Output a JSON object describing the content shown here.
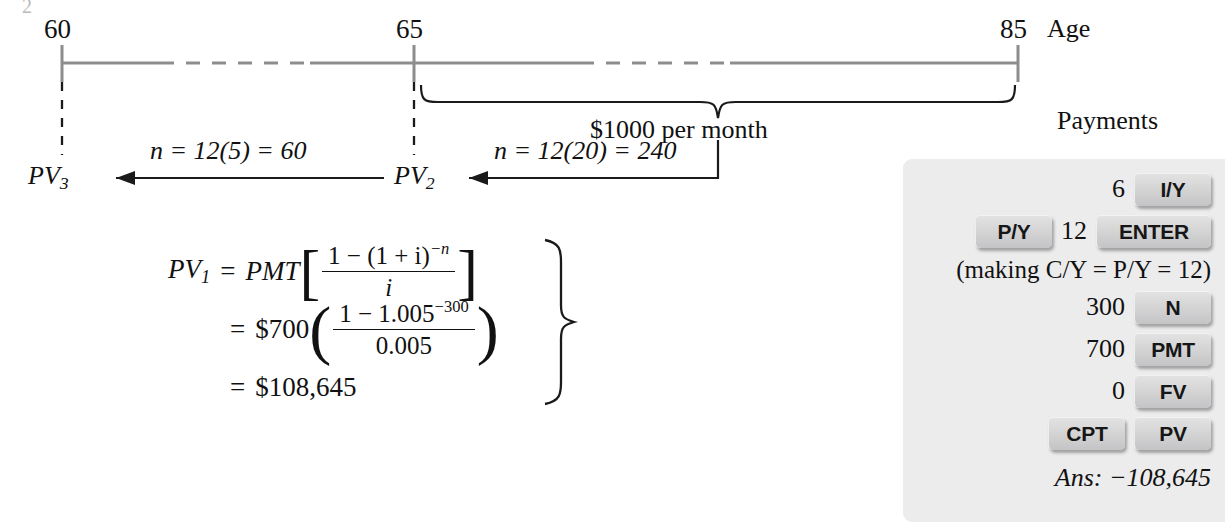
{
  "figure": {
    "stray_mark": "2",
    "timeline": {
      "ticks": [
        {
          "id": "age-60",
          "label": "60"
        },
        {
          "id": "age-65",
          "label": "65"
        },
        {
          "id": "age-85",
          "label": "85"
        }
      ],
      "axis_label": "Age",
      "payments_label": "Payments",
      "brace_label": "$1000 per month"
    },
    "arrows": [
      {
        "id": "pv3",
        "target": "PV",
        "target_sub": "3",
        "annotation": "n = 12(5) = 60"
      },
      {
        "id": "pv2",
        "target": "PV",
        "target_sub": "2",
        "annotation": "n = 12(20) = 240"
      }
    ],
    "formula": {
      "line1": {
        "lhs": "PV",
        "lhs_sub": "1",
        "eq": "=",
        "pmt": "PMT",
        "numerator": "1 − (1 + i)",
        "numerator_exp": "−n",
        "denominator": "i"
      },
      "line2": {
        "eq": "=",
        "coefficient": "$700",
        "numerator": "1 − 1.005",
        "numerator_exp": "−300",
        "denominator": "0.005"
      },
      "line3": {
        "eq": "=",
        "value": "$108,645"
      }
    }
  },
  "calculator": {
    "rows": [
      {
        "type": "key-row",
        "value": "6",
        "keys": [
          "I/Y"
        ]
      },
      {
        "type": "key-row",
        "value": "12",
        "keys": [
          "P/Y",
          "ENTER"
        ],
        "lead_key": "P/Y"
      },
      {
        "type": "note",
        "text": "(making C/Y = P/Y = 12)"
      },
      {
        "type": "key-row",
        "value": "300",
        "keys": [
          "N"
        ]
      },
      {
        "type": "key-row",
        "value": "700",
        "keys": [
          "PMT"
        ]
      },
      {
        "type": "key-row",
        "value": "0",
        "keys": [
          "FV"
        ]
      },
      {
        "type": "key-row",
        "value": "",
        "keys": [
          "CPT",
          "PV"
        ]
      },
      {
        "type": "answer",
        "text": "Ans: −108,645"
      }
    ],
    "keys": {
      "iy": "I/Y",
      "py": "P/Y",
      "enter": "ENTER",
      "n": "N",
      "pmt": "PMT",
      "fv": "FV",
      "cpt": "CPT",
      "pv": "PV"
    },
    "values": {
      "rate": "6",
      "periods_per_year": "12",
      "n": "300",
      "pmt": "700",
      "fv": "0"
    },
    "note": "(making C/Y = P/Y = 12)",
    "answer": "Ans: −108,645"
  },
  "colors": {
    "axis": "#8d8d8d",
    "ink": "#111111",
    "panel_bg": "#ececed",
    "key_face": "#d4d4d5"
  }
}
